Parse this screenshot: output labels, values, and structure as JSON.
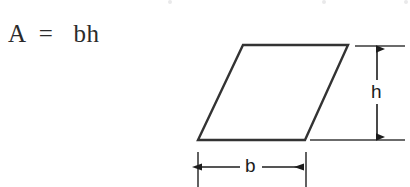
{
  "figure": {
    "formula": "A  =   bh",
    "shape_name": "parallelogram",
    "stroke_color": "#333333",
    "dimension_color": "#1c1c1c",
    "background_color": "#ffffff",
    "labels": {
      "height": "h",
      "base": "b"
    },
    "geometry": {
      "top_left": [
        243,
        45
      ],
      "top_right": [
        348,
        45
      ],
      "bottom_right": [
        305,
        140
      ],
      "bottom_left": [
        198,
        140
      ]
    },
    "height_dimension": {
      "arrow_x": 377,
      "top_y": 46,
      "bottom_y": 140,
      "upper_extension": [
        355,
        405
      ],
      "lower_extension": [
        310,
        405
      ]
    },
    "base_dimension": {
      "arrow_y": 167,
      "left_x": 198,
      "right_x": 306,
      "tick_top_y": 152,
      "tick_bottom_y": 187
    }
  }
}
